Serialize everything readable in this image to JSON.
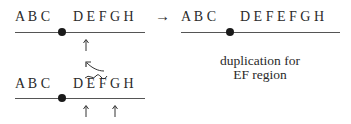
{
  "diagram": {
    "top_left": {
      "left_seq": "A B C",
      "right_seq": "D E F G H",
      "arrow_to_result": "→"
    },
    "top_right": {
      "left_seq": "A B C",
      "right_seq": "D E F E F G H"
    },
    "caption": {
      "line1": "duplication for",
      "line2": "EF region"
    },
    "bottom_left": {
      "left_seq": "A B C",
      "right_seq": "D E F G H",
      "tilde_over": "EF"
    }
  }
}
